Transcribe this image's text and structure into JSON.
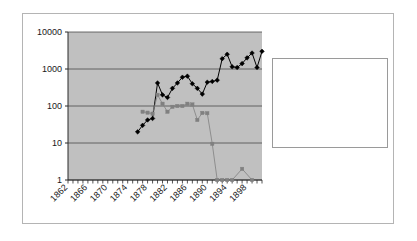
{
  "chart_data": {
    "type": "line",
    "title": "",
    "xlabel": "",
    "ylabel": "",
    "yscale": "log",
    "ylim": [
      1,
      10000
    ],
    "xlim": [
      1862,
      1901
    ],
    "grid": true,
    "plot_background": "#c0c0c0",
    "legend_position": "right",
    "y_ticks": [
      "1",
      "10",
      "100",
      "1000",
      "10000"
    ],
    "y_tick_values": [
      1,
      10,
      100,
      1000,
      10000
    ],
    "x_ticks": [
      "1862",
      "1866",
      "1870",
      "1874",
      "1878",
      "1882",
      "1886",
      "1890",
      "1894",
      "1898"
    ],
    "x_tick_values": [
      1862,
      1866,
      1870,
      1874,
      1878,
      1882,
      1886,
      1890,
      1894,
      1898
    ],
    "series": [
      {
        "name": "Scarlet fever admissions Isolation Hospital",
        "color": "#000000",
        "marker": "diamond",
        "x": [
          1876,
          1877,
          1878,
          1879,
          1880,
          1881,
          1882,
          1883,
          1884,
          1885,
          1886,
          1887,
          1888,
          1889,
          1890,
          1891,
          1892,
          1893,
          1894,
          1895,
          1896,
          1897,
          1898,
          1899,
          1900,
          1901
        ],
        "values": [
          20,
          30,
          42,
          46,
          420,
          200,
          170,
          300,
          420,
          600,
          640,
          400,
          300,
          210,
          440,
          460,
          500,
          1900,
          2500,
          1150,
          1100,
          1400,
          2000,
          2700,
          1100,
          3000
        ]
      },
      {
        "name": "Scarlet fever admissions Children's Hospital",
        "color": "#808080",
        "marker": "square",
        "x": [
          1877,
          1878,
          1879,
          1880,
          1881,
          1882,
          1883,
          1884,
          1885,
          1886,
          1887,
          1888,
          1889,
          1890,
          1891,
          1892,
          1893,
          1894,
          1895,
          1897,
          1899
        ],
        "values": [
          70,
          66,
          62,
          200,
          115,
          70,
          95,
          100,
          100,
          115,
          110,
          42,
          65,
          64,
          9.5,
          1,
          1,
          1,
          1,
          2,
          1
        ]
      }
    ]
  },
  "legend": {
    "entries": [
      {
        "label_lines": [
          "Scarlet fever",
          "admissions Isolation",
          "Hospital"
        ],
        "color": "#000000",
        "marker": "diamond"
      },
      {
        "label_lines": [
          "Scarlet fever",
          "admissions Children's",
          "Hospital"
        ],
        "color": "#808080",
        "marker": "square"
      }
    ]
  }
}
